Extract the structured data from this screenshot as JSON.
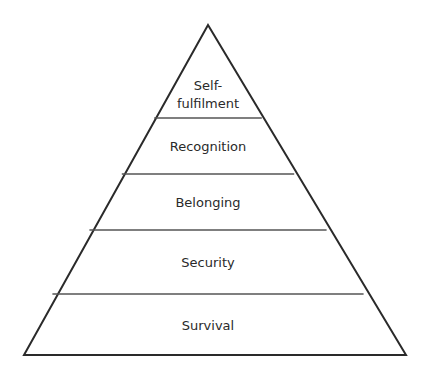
{
  "diagram": {
    "type": "pyramid",
    "levels": [
      {
        "label_line1": "Self-",
        "label_line2": "fulfilment"
      },
      {
        "label": "Recognition"
      },
      {
        "label": "Belonging"
      },
      {
        "label": "Security"
      },
      {
        "label": "Survival"
      }
    ],
    "colors": {
      "stroke": "#2a2a2a",
      "divider": "#555555",
      "fill": "#ffffff"
    }
  }
}
